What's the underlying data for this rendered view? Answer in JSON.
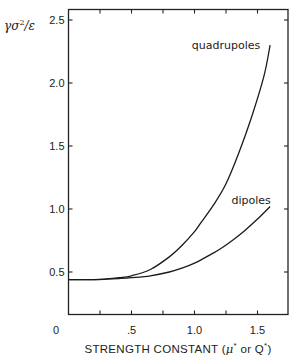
{
  "chart_data": {
    "type": "line",
    "title": "",
    "xlabel": "STRENGTH CONSTANT (μ* or Q*)",
    "ylabel": "γσ²/ε",
    "xlim": [
      0,
      1.75
    ],
    "ylim": [
      0.17,
      2.55
    ],
    "grid": false,
    "legend": "inline labels",
    "x_ticks": [
      0,
      0.25,
      0.5,
      0.75,
      1.0,
      1.25,
      1.5
    ],
    "x_tick_labels": [
      "0",
      "",
      ".5",
      "",
      "1.0",
      "",
      "1.5"
    ],
    "y_ticks": [
      0.5,
      1.0,
      1.5,
      2.0,
      2.5
    ],
    "y_tick_labels": [
      "0.5",
      "1.0",
      "1.5",
      "2.0",
      "2.5"
    ],
    "origin_label": "0",
    "series": [
      {
        "name": "quadrupoles",
        "x": [
          0,
          0.2,
          0.3,
          0.4,
          0.5,
          0.65,
          0.8,
          0.9,
          1.0,
          1.05,
          1.15,
          1.25,
          1.35,
          1.45,
          1.55,
          1.6
        ],
        "values": [
          0.44,
          0.44,
          0.445,
          0.455,
          0.47,
          0.52,
          0.62,
          0.71,
          0.82,
          0.89,
          1.03,
          1.2,
          1.44,
          1.72,
          2.05,
          2.3
        ]
      },
      {
        "name": "dipoles",
        "x": [
          0,
          0.2,
          0.3,
          0.4,
          0.5,
          0.65,
          0.8,
          0.9,
          1.0,
          1.13,
          1.2,
          1.3,
          1.4,
          1.5,
          1.6
        ],
        "values": [
          0.44,
          0.44,
          0.443,
          0.448,
          0.455,
          0.47,
          0.5,
          0.53,
          0.57,
          0.64,
          0.68,
          0.75,
          0.83,
          0.92,
          1.02
        ]
      }
    ],
    "annotations": [
      {
        "text": "quadrupoles",
        "x": 1.25,
        "y": 2.3
      },
      {
        "text": "dipoles",
        "x": 1.45,
        "y": 1.07
      }
    ]
  }
}
